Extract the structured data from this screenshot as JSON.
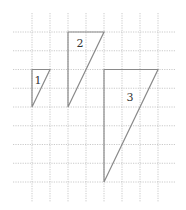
{
  "figure": {
    "grid": {
      "columns_x": [
        32,
        50,
        68,
        86,
        104,
        122,
        140,
        158
      ],
      "rows_y": [
        32,
        50.75,
        69.5,
        88.25,
        107,
        125.75,
        144.5,
        163.25,
        182
      ],
      "x_extent": [
        13,
        176
      ],
      "y_extent": [
        13,
        202
      ],
      "color": "#bcbcbc"
    },
    "stroke_color": "#8a8a8a",
    "triangles": [
      {
        "label": "1",
        "points": "32,69.5 50,69.5 32,107",
        "label_pos": [
          38,
          80
        ]
      },
      {
        "label": "2",
        "points": "68,32 104,32 68,107",
        "label_pos": [
          80,
          43
        ]
      },
      {
        "label": "3",
        "points": "104,69.5 158,69.5 104,182",
        "label_pos": [
          130,
          97
        ]
      }
    ]
  }
}
